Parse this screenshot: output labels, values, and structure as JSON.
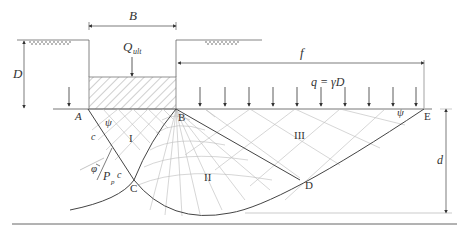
{
  "diagram": {
    "labels": {
      "width": "B",
      "load": "Q",
      "load_sub": "ult",
      "depth": "D",
      "extent": "f",
      "surcharge": "q = γD",
      "failure_depth": "d",
      "point_a": "A",
      "point_b": "B",
      "point_c": "C",
      "point_d": "D",
      "point_e": "E",
      "zone_1": "I",
      "zone_2": "II",
      "zone_3": "III",
      "psi_left": "ψ",
      "psi_right": "ψ",
      "cohesion_upper": "c",
      "cohesion_lower": "c",
      "phi": "φ",
      "passive": "P",
      "passive_sub": "p"
    },
    "colors": {
      "line": "#444444",
      "grid": "#bbbbbb",
      "hatch": "#888888"
    }
  }
}
